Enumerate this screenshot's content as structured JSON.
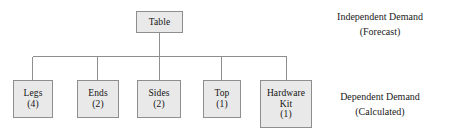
{
  "diagram": {
    "root": {
      "id": "table",
      "label": "Table",
      "quantity": ""
    },
    "children": [
      {
        "id": "legs",
        "label": "Legs",
        "quantity": "(4)"
      },
      {
        "id": "ends",
        "label": "Ends",
        "quantity": "(2)"
      },
      {
        "id": "sides",
        "label": "Sides",
        "quantity": "(2)"
      },
      {
        "id": "top",
        "label": "Top",
        "quantity": "(1)"
      },
      {
        "id": "hardware",
        "label": "Hardware",
        "label2": "Kit",
        "quantity": "(1)"
      }
    ],
    "annotations": {
      "independent": {
        "line1": "Independent Demand",
        "line2": "(Forecast)"
      },
      "dependent": {
        "line1": "Dependent Demand",
        "line2": "(Calculated)"
      }
    },
    "colors": {
      "box_fill": "#e9e9e9",
      "box_border": "#8e8e8e",
      "line": "#8e8e8e",
      "text": "#141414",
      "background": "#ffffff"
    }
  }
}
